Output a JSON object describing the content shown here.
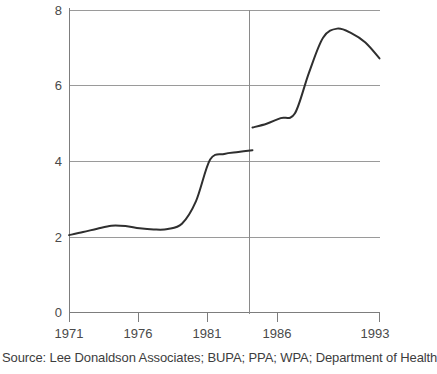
{
  "chart_data": {
    "type": "line",
    "title": "",
    "subtitle": "",
    "xlabel": "",
    "ylabel": "",
    "xlim": [
      1971,
      1993
    ],
    "ylim": [
      0,
      8
    ],
    "yticks": [
      0,
      2,
      4,
      6,
      8
    ],
    "ytick_labels": [
      "0",
      "2",
      "4",
      "6",
      "8"
    ],
    "xticks": [
      1971,
      1976,
      1981,
      1986,
      1993
    ],
    "xtick_labels": [
      "1971",
      "1976",
      "1981",
      "1986",
      "1993"
    ],
    "grid": "horizontal",
    "legend": "none",
    "annotations": [
      {
        "name": "series-break-line",
        "type": "vertical-line",
        "x": 1984,
        "note": "series discontinuity / definition change"
      }
    ],
    "series": [
      {
        "name": "segment-1971-1984",
        "x": [
          1971,
          1972,
          1973,
          1974,
          1975,
          1976,
          1977,
          1978,
          1979,
          1980,
          1981,
          1982,
          1983,
          1984
        ],
        "values": [
          2.05,
          2.13,
          2.22,
          2.3,
          2.29,
          2.23,
          2.2,
          2.21,
          2.35,
          2.95,
          4.05,
          4.2,
          4.25,
          4.3
        ]
      },
      {
        "name": "segment-1984-1993",
        "x": [
          1984,
          1985,
          1986,
          1987,
          1988,
          1989,
          1990,
          1991,
          1992,
          1993
        ],
        "values": [
          4.9,
          5.0,
          5.15,
          5.27,
          6.35,
          7.28,
          7.52,
          7.4,
          7.15,
          6.73
        ]
      }
    ]
  },
  "footer": {
    "source_note": "Source: Lee Donaldson Associates; BUPA; PPA; WPA; Department of Health"
  },
  "colors": {
    "series_line": "#2f2f2f",
    "gridline": "#9a9a9a",
    "axis": "#7d7d7d",
    "text": "#3d3d3d",
    "background": "#ffffff"
  }
}
